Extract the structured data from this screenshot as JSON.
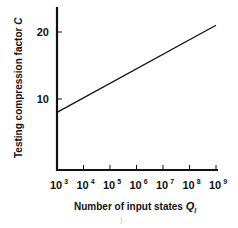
{
  "chart_data": {
    "type": "line",
    "title": "",
    "xlabel": "Number of input states",
    "xlabel_symbol": "Q",
    "xlabel_subscript": "I",
    "ylabel": "Testing compression factor",
    "ylabel_symbol": "C",
    "x_scale": "log10",
    "x_ticks": [
      {
        "base": "10",
        "exp": "3",
        "value": 1000
      },
      {
        "base": "10",
        "exp": "4",
        "value": 10000
      },
      {
        "base": "10",
        "exp": "5",
        "value": 100000
      },
      {
        "base": "10",
        "exp": "6",
        "value": 1000000
      },
      {
        "base": "10",
        "exp": "7",
        "value": 10000000
      },
      {
        "base": "10",
        "exp": "8",
        "value": 100000000
      },
      {
        "base": "10",
        "exp": "9",
        "value": 1000000000
      }
    ],
    "y_ticks": [
      10,
      20
    ],
    "xlim": [
      1000,
      1000000000
    ],
    "ylim": [
      0,
      23.5
    ],
    "grid": false,
    "legend": null,
    "series": [
      {
        "name": "C vs Q_I",
        "x": [
          1000,
          1000000000
        ],
        "y": [
          8,
          21
        ]
      }
    ],
    "color": "#111111"
  }
}
